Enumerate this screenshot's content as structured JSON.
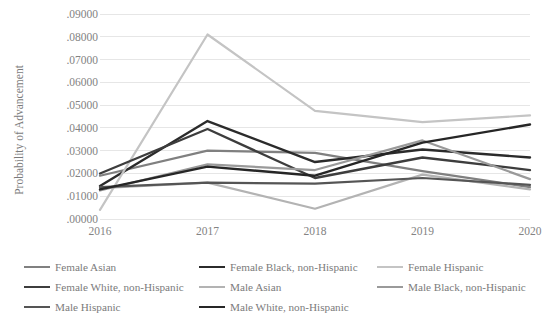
{
  "chart_data": {
    "type": "line",
    "title": "",
    "xlabel": "",
    "ylabel": "Probability of Advancement",
    "categories": [
      "2016",
      "2017",
      "2018",
      "2019",
      "2020"
    ],
    "x": [
      2016,
      2017,
      2018,
      2019,
      2020
    ],
    "ylim": [
      0.0,
      0.09
    ],
    "ytick_labels": [
      ".00000",
      ".01000",
      ".02000",
      ".03000",
      ".04000",
      ".05000",
      ".06000",
      ".07000",
      ".08000",
      ".09000"
    ],
    "ytick_values": [
      0.0,
      0.01,
      0.02,
      0.03,
      0.04,
      0.05,
      0.06,
      0.07,
      0.08,
      0.09
    ],
    "grid": true,
    "grid_axis": "y",
    "legend_position": "bottom",
    "legend_columns": 3,
    "series": [
      {
        "name": "Female Asian",
        "color": "#808080",
        "width": 2.2,
        "values": [
          0.019,
          0.03,
          0.029,
          0.021,
          0.014
        ]
      },
      {
        "name": "Female Black, non-Hispanic",
        "color": "#2b2b2b",
        "width": 2.4,
        "values": [
          0.0145,
          0.043,
          0.025,
          0.0305,
          0.027
        ]
      },
      {
        "name": "Female Hispanic",
        "color": "#c4c4c4",
        "width": 2.2,
        "values": [
          0.004,
          0.081,
          0.0475,
          0.0425,
          0.0455
        ]
      },
      {
        "name": "Female White, non-Hispanic",
        "color": "#3d3d3d",
        "width": 2.3,
        "values": [
          0.02,
          0.0395,
          0.018,
          0.027,
          0.0215
        ]
      },
      {
        "name": "Male Asian",
        "color": "#b3b3b3",
        "width": 2.2,
        "values": [
          0.0135,
          0.016,
          0.0045,
          0.0195,
          0.013
        ]
      },
      {
        "name": "Male Black, non-Hispanic",
        "color": "#9a9a9a",
        "width": 2.2,
        "values": [
          0.0125,
          0.024,
          0.0215,
          0.0345,
          0.0175
        ]
      },
      {
        "name": "Male Hispanic",
        "color": "#555555",
        "width": 2.2,
        "values": [
          0.014,
          0.016,
          0.0155,
          0.018,
          0.015
        ]
      },
      {
        "name": "Male White, non-Hispanic",
        "color": "#262626",
        "width": 2.4,
        "values": [
          0.013,
          0.023,
          0.019,
          0.0335,
          0.0415
        ]
      }
    ]
  },
  "legend": {
    "rows": [
      [
        {
          "label": "Female Asian",
          "color": "#808080",
          "left": 0,
          "width": 175
        },
        {
          "label": "Female Black, non-Hispanic",
          "color": "#2b2b2b",
          "left": 175,
          "width": 178
        },
        {
          "label": "Female Hispanic",
          "color": "#c4c4c4",
          "left": 353,
          "width": 175
        }
      ],
      [
        {
          "label": "Female White, non-Hispanic",
          "color": "#3d3d3d",
          "left": 0,
          "width": 175
        },
        {
          "label": "Male Asian",
          "color": "#b3b3b3",
          "left": 175,
          "width": 178
        },
        {
          "label": "Male Black, non-Hispanic",
          "color": "#9a9a9a",
          "left": 353,
          "width": 175
        }
      ],
      [
        {
          "label": "Male Hispanic",
          "color": "#555555",
          "left": 0,
          "width": 175
        },
        {
          "label": "Male White, non-Hispanic",
          "color": "#262626",
          "left": 175,
          "width": 178
        }
      ]
    ]
  },
  "plot": {
    "left": 100,
    "right": 530,
    "top": 14,
    "bottom": 219,
    "grid_color": "#e6e6e6",
    "background": "#ffffff"
  }
}
